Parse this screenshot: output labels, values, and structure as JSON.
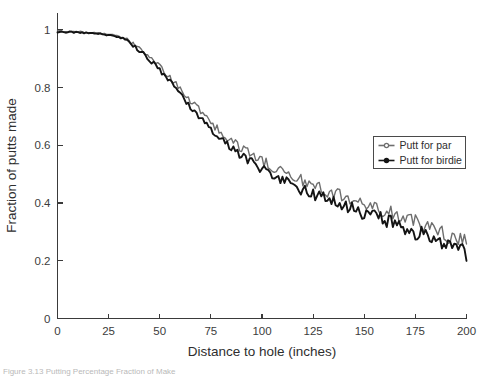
{
  "figure": {
    "caption_fragment": "Figure 3.13 Putting Percentage Fraction of Make"
  },
  "legend": {
    "position": "right-middle",
    "entries": [
      {
        "label": "Putt for par",
        "color": "#6e6e6e",
        "marker": "open-circle-marker"
      },
      {
        "label": "Putt for birdie",
        "color": "#141414",
        "marker": "filled-circle-marker"
      }
    ]
  },
  "chart_data": {
    "type": "line",
    "title": "",
    "xlabel": "Distance to hole (inches)",
    "ylabel": "Fraction of putts made",
    "xlim": [
      0,
      200
    ],
    "ylim": [
      0,
      1.06
    ],
    "xticks": [
      0,
      25,
      50,
      75,
      100,
      125,
      150,
      175,
      200
    ],
    "xticklabels": [
      "0",
      "25",
      "50",
      "75",
      "100",
      "125",
      "150",
      "175",
      "200"
    ],
    "yticks": [
      0,
      0.2,
      0.4,
      0.6,
      0.8,
      1
    ],
    "yticklabels": [
      "0",
      "0.2",
      "0.4",
      "0.6",
      "0.8",
      "1"
    ],
    "grid": false,
    "series": [
      {
        "name": "Putt for par",
        "color": "#6e6e6e",
        "x": [
          0,
          2,
          4,
          6,
          8,
          10,
          12,
          14,
          16,
          18,
          20,
          22,
          24,
          26,
          28,
          30,
          32,
          34,
          36,
          38,
          40,
          42,
          44,
          46,
          48,
          50,
          52,
          54,
          56,
          58,
          60,
          62,
          64,
          66,
          68,
          70,
          72,
          74,
          76,
          78,
          80,
          82,
          84,
          86,
          88,
          90,
          92,
          94,
          96,
          98,
          100,
          102,
          104,
          106,
          108,
          110,
          112,
          114,
          116,
          118,
          120,
          122,
          124,
          126,
          128,
          130,
          132,
          134,
          136,
          138,
          140,
          142,
          144,
          146,
          148,
          150,
          152,
          154,
          156,
          158,
          160,
          162,
          164,
          166,
          168,
          170,
          172,
          174,
          176,
          178,
          180,
          182,
          184,
          186,
          188,
          190,
          192,
          194,
          196,
          198,
          200
        ],
        "values": [
          0.995,
          0.995,
          0.994,
          0.994,
          0.993,
          0.993,
          0.992,
          0.992,
          0.991,
          0.99,
          0.989,
          0.988,
          0.986,
          0.984,
          0.981,
          0.977,
          0.972,
          0.966,
          0.958,
          0.949,
          0.939,
          0.928,
          0.916,
          0.903,
          0.889,
          0.874,
          0.859,
          0.843,
          0.827,
          0.811,
          0.795,
          0.778,
          0.762,
          0.746,
          0.731,
          0.716,
          0.701,
          0.687,
          0.673,
          0.66,
          0.647,
          0.635,
          0.623,
          0.612,
          0.601,
          0.591,
          0.581,
          0.572,
          0.563,
          0.554,
          0.546,
          0.538,
          0.53,
          0.523,
          0.516,
          0.509,
          0.502,
          0.496,
          0.489,
          0.483,
          0.477,
          0.471,
          0.465,
          0.459,
          0.453,
          0.448,
          0.442,
          0.437,
          0.431,
          0.426,
          0.421,
          0.416,
          0.411,
          0.406,
          0.401,
          0.396,
          0.391,
          0.386,
          0.381,
          0.376,
          0.371,
          0.366,
          0.361,
          0.356,
          0.351,
          0.346,
          0.341,
          0.336,
          0.331,
          0.326,
          0.32,
          0.315,
          0.309,
          0.304,
          0.298,
          0.292,
          0.286,
          0.28,
          0.273,
          0.266,
          0.259
        ]
      },
      {
        "name": "Putt for birdie",
        "color": "#141414",
        "x": [
          0,
          2,
          4,
          6,
          8,
          10,
          12,
          14,
          16,
          18,
          20,
          22,
          24,
          26,
          28,
          30,
          32,
          34,
          36,
          38,
          40,
          42,
          44,
          46,
          48,
          50,
          52,
          54,
          56,
          58,
          60,
          62,
          64,
          66,
          68,
          70,
          72,
          74,
          76,
          78,
          80,
          82,
          84,
          86,
          88,
          90,
          92,
          94,
          96,
          98,
          100,
          102,
          104,
          106,
          108,
          110,
          112,
          114,
          116,
          118,
          120,
          122,
          124,
          126,
          128,
          130,
          132,
          134,
          136,
          138,
          140,
          142,
          144,
          146,
          148,
          150,
          152,
          154,
          156,
          158,
          160,
          162,
          164,
          166,
          168,
          170,
          172,
          174,
          176,
          178,
          180,
          182,
          184,
          186,
          188,
          190,
          192,
          194,
          196,
          198,
          200
        ],
        "values": [
          0.993,
          0.993,
          0.992,
          0.992,
          0.991,
          0.991,
          0.99,
          0.99,
          0.989,
          0.988,
          0.987,
          0.985,
          0.983,
          0.981,
          0.978,
          0.973,
          0.967,
          0.96,
          0.951,
          0.941,
          0.93,
          0.918,
          0.905,
          0.891,
          0.876,
          0.861,
          0.845,
          0.828,
          0.811,
          0.794,
          0.777,
          0.76,
          0.743,
          0.726,
          0.71,
          0.694,
          0.679,
          0.664,
          0.65,
          0.636,
          0.623,
          0.61,
          0.598,
          0.586,
          0.575,
          0.564,
          0.554,
          0.544,
          0.535,
          0.526,
          0.517,
          0.509,
          0.501,
          0.493,
          0.486,
          0.479,
          0.472,
          0.465,
          0.458,
          0.452,
          0.446,
          0.44,
          0.434,
          0.428,
          0.422,
          0.416,
          0.411,
          0.405,
          0.4,
          0.394,
          0.389,
          0.384,
          0.379,
          0.374,
          0.369,
          0.364,
          0.359,
          0.354,
          0.349,
          0.344,
          0.339,
          0.334,
          0.329,
          0.324,
          0.319,
          0.314,
          0.309,
          0.304,
          0.299,
          0.293,
          0.288,
          0.283,
          0.277,
          0.272,
          0.266,
          0.26,
          0.254,
          0.248,
          0.241,
          0.234,
          0.227
        ]
      }
    ]
  }
}
